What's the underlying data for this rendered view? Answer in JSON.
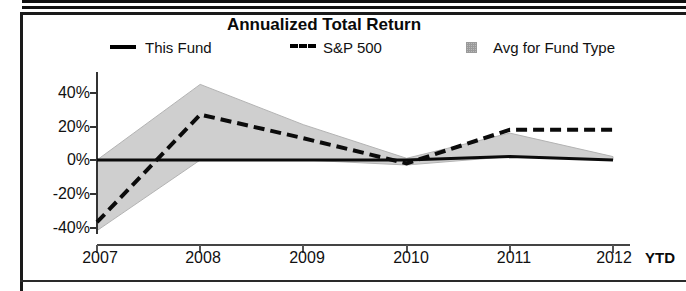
{
  "chart_data": {
    "type": "area",
    "title": "Annualized Total Return",
    "xlabel": "",
    "ylabel": "",
    "grid": false,
    "legend_position": "top",
    "x": [
      "2007",
      "2008",
      "2009",
      "2010",
      "2011",
      "2012"
    ],
    "xtick_labels": [
      "2007",
      "2008",
      "2009",
      "2010",
      "2011",
      "2012"
    ],
    "x_axis_suffix": "YTD",
    "ytick_labels": [
      "40%",
      "20%",
      "0%",
      "-20%",
      "-40%"
    ],
    "ytick_values": [
      40,
      20,
      0,
      -20,
      -40
    ],
    "ylim": [
      -46,
      50
    ],
    "series": [
      {
        "name": "This Fund",
        "style": "solid-line",
        "color": "#000000",
        "values": [
          0,
          0,
          0,
          0,
          2,
          0
        ]
      },
      {
        "name": "S&P 500",
        "style": "dashed-line",
        "color": "#000000",
        "values": [
          -37,
          27,
          13,
          -2,
          18,
          18
        ]
      },
      {
        "name": "Avg for Fund Type",
        "style": "shaded-band",
        "color": "#c8c8c8",
        "band_upper": [
          0,
          45,
          21,
          1,
          16,
          2
        ],
        "band_lower": [
          -42,
          0,
          0,
          -3,
          2,
          0
        ]
      }
    ]
  },
  "legend": {
    "items": [
      {
        "label": "This Fund",
        "swatch": "solid-line-swatch"
      },
      {
        "label": "S&P 500",
        "swatch": "dashed-line-swatch"
      },
      {
        "label": "Avg for Fund Type",
        "swatch": "shaded-square-swatch"
      }
    ]
  },
  "axis": {
    "y_ticks": [
      "40%",
      "20%",
      "0%",
      "-20%",
      "-40%"
    ],
    "x_ticks": [
      "2007",
      "2008",
      "2009",
      "2010",
      "2011",
      "2012"
    ],
    "x_suffix": "YTD"
  }
}
